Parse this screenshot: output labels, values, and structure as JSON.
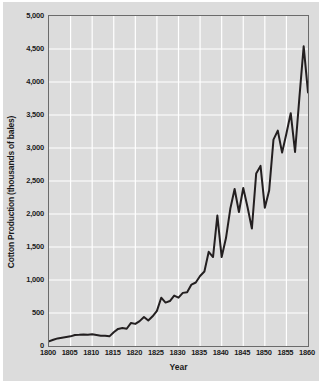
{
  "chart_data": {
    "type": "line",
    "title": "",
    "xlabel": "Year",
    "ylabel": "Cotton Production (thousands of bales)",
    "xlim": [
      1800,
      1860
    ],
    "ylim": [
      0,
      5000
    ],
    "grid": true,
    "legend": "none",
    "line_color": "#231f20",
    "plot_bg": "#dcdcdc",
    "grid_color": "#ffffff",
    "frame_color": "#6b6b6b",
    "xticks": [
      1800,
      1805,
      1810,
      1815,
      1820,
      1825,
      1830,
      1835,
      1840,
      1845,
      1850,
      1855,
      1860
    ],
    "xticklabels": [
      "1800",
      "1805",
      "1810",
      "1815",
      "1820",
      "1825",
      "1830",
      "1835",
      "1840",
      "1845",
      "1850",
      "1855",
      "1860"
    ],
    "yticks": [
      0,
      500,
      1000,
      1500,
      2000,
      2500,
      3000,
      3500,
      4000,
      4500,
      5000
    ],
    "yticklabels": [
      "0",
      "500",
      "1,000",
      "1,500",
      "2,000",
      "2,500",
      "3,000",
      "3,500",
      "4,000",
      "4,500",
      "5,000"
    ],
    "x": [
      1800,
      1801,
      1802,
      1803,
      1804,
      1805,
      1806,
      1807,
      1808,
      1809,
      1810,
      1811,
      1812,
      1813,
      1814,
      1815,
      1816,
      1817,
      1818,
      1819,
      1820,
      1821,
      1822,
      1823,
      1824,
      1825,
      1826,
      1827,
      1828,
      1829,
      1830,
      1831,
      1832,
      1833,
      1834,
      1835,
      1836,
      1837,
      1838,
      1839,
      1840,
      1841,
      1842,
      1843,
      1844,
      1845,
      1846,
      1847,
      1848,
      1849,
      1850,
      1851,
      1852,
      1853,
      1854,
      1855,
      1856,
      1857,
      1858,
      1859,
      1860
    ],
    "y": [
      73,
      95,
      115,
      125,
      135,
      146,
      167,
      170,
      175,
      172,
      178,
      167,
      157,
      156,
      146,
      209,
      259,
      272,
      261,
      349,
      335,
      377,
      439,
      386,
      450,
      533,
      732,
      658,
      681,
      763,
      732,
      805,
      816,
      931,
      962,
      1061,
      1128,
      1427,
      1348,
      1976,
      1348,
      1635,
      2079,
      2379,
      2030,
      2395,
      2101,
      1779,
      2615,
      2729,
      2096,
      2355,
      3126,
      3263,
      2930,
      3221,
      3528,
      2940,
      3759,
      4541,
      3841
    ],
    "peaks_annotated": [
      {
        "year": 1859,
        "value": 4541
      },
      {
        "year": 1860,
        "value": 3841
      },
      {
        "year": 1839,
        "value": 1976
      },
      {
        "year": 1843,
        "value": 2379
      },
      {
        "year": 1849,
        "value": 2729
      },
      {
        "year": 1852,
        "value": 3126
      },
      {
        "year": 1855,
        "value": 3221
      },
      {
        "year": 1857,
        "value": 3528
      }
    ]
  }
}
